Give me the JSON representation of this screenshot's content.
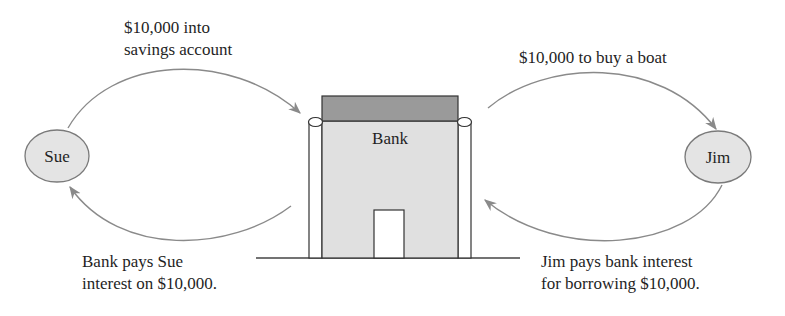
{
  "diagram": {
    "type": "flow-diagram",
    "nodes": {
      "sue": {
        "label": "Sue"
      },
      "bank": {
        "label": "Bank"
      },
      "jim": {
        "label": "Jim"
      }
    },
    "edges": {
      "sue_to_bank": {
        "line1": "$10,000 into",
        "line2": "savings account"
      },
      "bank_to_sue": {
        "line1": "Bank pays Sue",
        "line2": "interest on $10,000."
      },
      "bank_to_jim": {
        "line1": "$10,000 to buy a boat"
      },
      "jim_to_bank": {
        "line1": "Jim pays bank interest",
        "line2": "for borrowing $10,000."
      }
    },
    "colors": {
      "node_fill": "#e4e4e4",
      "node_stroke": "#7a7a7a",
      "roof_fill": "#9a9a9a",
      "bank_fill": "#e0e0e0",
      "arrow": "#8a8a8a",
      "line": "#333333"
    }
  }
}
